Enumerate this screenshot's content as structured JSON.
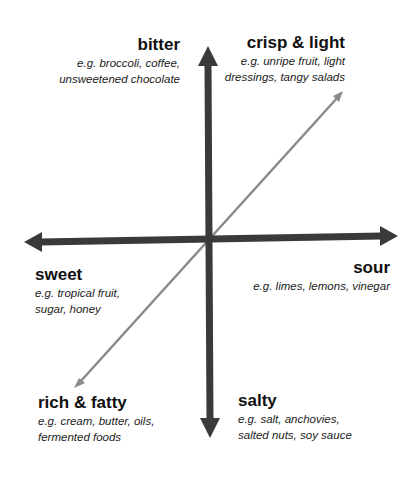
{
  "diagram": {
    "type": "flavor-quadrant",
    "colors": {
      "axis": "#3a3a3a",
      "diagonal": "#8a8a8a",
      "text": "#111111"
    },
    "labels": {
      "bitter": {
        "title": "bitter",
        "line1": "e.g. broccoli, coffee,",
        "line2": "unsweetened chocolate"
      },
      "crisp_light": {
        "title": "crisp & light",
        "line1": "e.g. unripe fruit, light",
        "line2": "dressings, tangy salads"
      },
      "sweet": {
        "title": "sweet",
        "line1": "e.g. tropical fruit,",
        "line2": "sugar, honey"
      },
      "sour": {
        "title": "sour",
        "line1": "e.g. limes, lemons, vinegar"
      },
      "rich_fatty": {
        "title": "rich & fatty",
        "line1": "e.g. cream, butter, oils,",
        "line2": "fermented foods"
      },
      "salty": {
        "title": "salty",
        "line1": "e.g. salt, anchovies,",
        "line2": "salted nuts, soy sauce"
      }
    }
  }
}
